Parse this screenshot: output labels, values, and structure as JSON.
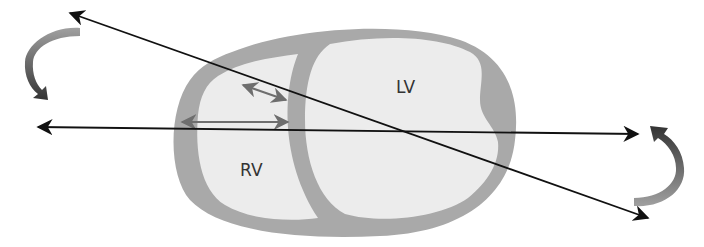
{
  "diagram": {
    "labels": {
      "lv": "LV",
      "rv": "RV"
    },
    "colors": {
      "background": "#ffffff",
      "myocardium": "#a8a8a8",
      "cavity": "#ececec",
      "line": "#111111",
      "measure_arrow": "#6e6e6e",
      "rotation_arrow_light": "#9a9a9a",
      "rotation_arrow_dark": "#3a3a3a"
    }
  }
}
